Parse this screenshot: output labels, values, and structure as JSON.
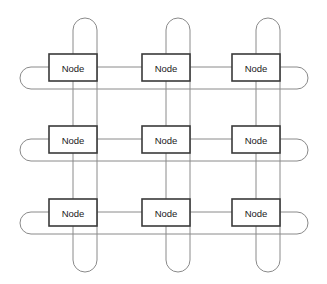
{
  "diagram": {
    "topology_type": "torus",
    "grid": {
      "rows": 3,
      "cols": 3
    },
    "canvas": {
      "width": 327,
      "height": 284,
      "background": "#ffffff"
    },
    "style": {
      "link_color": "#8a8a8a",
      "link_width": 1,
      "node_fill": "#ffffff",
      "node_stroke": "#3a3a3a",
      "node_stroke_width": 1.6,
      "label_color": "#1a1a1a",
      "label_size": 9.5
    },
    "node_label": "Node",
    "node_size": {
      "width": 48,
      "height": 27
    },
    "nodes": [
      {
        "id": "n00",
        "row": 0,
        "col": 0,
        "label": "Node",
        "x": 49,
        "y": 54,
        "cx": 73,
        "cy": 67
      },
      {
        "id": "n01",
        "row": 0,
        "col": 1,
        "label": "Node",
        "x": 142,
        "y": 54,
        "cx": 166,
        "cy": 67
      },
      {
        "id": "n02",
        "row": 0,
        "col": 2,
        "label": "Node",
        "x": 232,
        "y": 54,
        "cx": 256,
        "cy": 67
      },
      {
        "id": "n10",
        "row": 1,
        "col": 0,
        "label": "Node",
        "x": 49,
        "y": 126,
        "cx": 73,
        "cy": 139
      },
      {
        "id": "n11",
        "row": 1,
        "col": 1,
        "label": "Node",
        "x": 142,
        "y": 126,
        "cx": 166,
        "cy": 139
      },
      {
        "id": "n12",
        "row": 1,
        "col": 2,
        "label": "Node",
        "x": 232,
        "y": 126,
        "cx": 256,
        "cy": 139
      },
      {
        "id": "n20",
        "row": 2,
        "col": 0,
        "label": "Node",
        "x": 49,
        "y": 199,
        "cx": 73,
        "cy": 212
      },
      {
        "id": "n21",
        "row": 2,
        "col": 1,
        "label": "Node",
        "x": 142,
        "y": 199,
        "cx": 166,
        "cy": 212
      },
      {
        "id": "n22",
        "row": 2,
        "col": 2,
        "label": "Node",
        "x": 232,
        "y": 199,
        "cx": 256,
        "cy": 212
      }
    ],
    "row_axis": {
      "center_ys": [
        67,
        139,
        212
      ],
      "return_offset": 22,
      "left_arc_x": 20,
      "right_arc_x": 308,
      "left_node_edge": 49,
      "right_node_edge": 280
    },
    "column_axis": {
      "center_xs": [
        73,
        166,
        256
      ],
      "return_offset": 24,
      "top_arc_y": 18,
      "bottom_arc_y": 272,
      "top_node_edge": 54,
      "bottom_node_edge": 226
    },
    "wrap_links": {
      "rows": [
        {
          "row": 0,
          "kind": "horizontal-wraparound",
          "from": "n02",
          "to": "n00"
        },
        {
          "row": 1,
          "kind": "horizontal-wraparound",
          "from": "n12",
          "to": "n10"
        },
        {
          "row": 2,
          "kind": "horizontal-wraparound",
          "from": "n22",
          "to": "n20"
        }
      ],
      "cols": [
        {
          "col": 0,
          "kind": "vertical-wraparound",
          "from": "n20",
          "to": "n00"
        },
        {
          "col": 1,
          "kind": "vertical-wraparound",
          "from": "n21",
          "to": "n01"
        },
        {
          "col": 2,
          "kind": "vertical-wraparound",
          "from": "n22",
          "to": "n02"
        }
      ]
    },
    "row_links": [
      {
        "row": 0,
        "from": "n00",
        "to": "n01"
      },
      {
        "row": 0,
        "from": "n01",
        "to": "n02"
      },
      {
        "row": 1,
        "from": "n10",
        "to": "n11"
      },
      {
        "row": 1,
        "from": "n11",
        "to": "n12"
      },
      {
        "row": 2,
        "from": "n20",
        "to": "n21"
      },
      {
        "row": 2,
        "from": "n21",
        "to": "n22"
      }
    ],
    "col_links": [
      {
        "col": 0,
        "from": "n00",
        "to": "n10"
      },
      {
        "col": 0,
        "from": "n10",
        "to": "n20"
      },
      {
        "col": 1,
        "from": "n01",
        "to": "n11"
      },
      {
        "col": 1,
        "from": "n11",
        "to": "n21"
      },
      {
        "col": 2,
        "from": "n02",
        "to": "n12"
      },
      {
        "col": 2,
        "from": "n12",
        "to": "n22"
      }
    ]
  }
}
